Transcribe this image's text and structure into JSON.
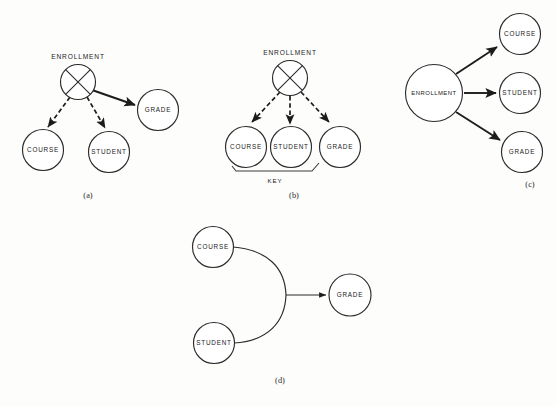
{
  "figure": {
    "background_color": "#fdfdfc",
    "stroke_color": "#1c1c1c",
    "panels": [
      {
        "id": "a",
        "caption": "(a)",
        "nodes": [
          {
            "name": "ENROLLMENT",
            "label": "ENROLLMENT",
            "shape": "crossed-circle",
            "label_position": "above"
          },
          {
            "name": "COURSE",
            "label": "COURSE",
            "shape": "circle",
            "label_position": "inside"
          },
          {
            "name": "STUDENT",
            "label": "STUDENT",
            "shape": "circle",
            "label_position": "inside"
          },
          {
            "name": "GRADE",
            "label": "GRADE",
            "shape": "circle",
            "label_position": "inside"
          }
        ],
        "edges": [
          {
            "from": "ENROLLMENT",
            "to": "COURSE",
            "style": "dashed",
            "arrow": true
          },
          {
            "from": "ENROLLMENT",
            "to": "STUDENT",
            "style": "dashed",
            "arrow": true
          },
          {
            "from": "ENROLLMENT",
            "to": "GRADE",
            "style": "solid",
            "arrow": true
          }
        ]
      },
      {
        "id": "b",
        "caption": "(b)",
        "key_label": "KEY",
        "nodes": [
          {
            "name": "ENROLLMENT",
            "label": "ENROLLMENT",
            "shape": "crossed-circle",
            "label_position": "above"
          },
          {
            "name": "COURSE",
            "label": "COURSE",
            "shape": "circle",
            "label_position": "inside"
          },
          {
            "name": "STUDENT",
            "label": "STUDENT",
            "shape": "circle",
            "label_position": "inside"
          },
          {
            "name": "GRADE",
            "label": "GRADE",
            "shape": "circle",
            "label_position": "inside"
          }
        ],
        "edges": [
          {
            "from": "ENROLLMENT",
            "to": "COURSE",
            "style": "dashed",
            "arrow": true
          },
          {
            "from": "ENROLLMENT",
            "to": "STUDENT",
            "style": "dashed",
            "arrow": true
          },
          {
            "from": "ENROLLMENT",
            "to": "GRADE",
            "style": "dashed",
            "arrow": true
          }
        ]
      },
      {
        "id": "c",
        "caption": "(c)",
        "nodes": [
          {
            "name": "ENROLLMENT",
            "label": "ENROLLMENT",
            "shape": "circle",
            "label_position": "inside"
          },
          {
            "name": "COURSE",
            "label": "COURSE",
            "shape": "circle",
            "label_position": "inside"
          },
          {
            "name": "STUDENT",
            "label": "STUDENT",
            "shape": "circle",
            "label_position": "inside"
          },
          {
            "name": "GRADE",
            "label": "GRADE",
            "shape": "circle",
            "label_position": "inside"
          }
        ],
        "edges": [
          {
            "from": "ENROLLMENT",
            "to": "COURSE",
            "style": "solid",
            "arrow": true
          },
          {
            "from": "ENROLLMENT",
            "to": "STUDENT",
            "style": "solid",
            "arrow": true
          },
          {
            "from": "ENROLLMENT",
            "to": "GRADE",
            "style": "solid",
            "arrow": true
          }
        ]
      },
      {
        "id": "d",
        "caption": "(d)",
        "nodes": [
          {
            "name": "COURSE",
            "label": "COURSE",
            "shape": "circle",
            "label_position": "inside"
          },
          {
            "name": "STUDENT",
            "label": "STUDENT",
            "shape": "circle",
            "label_position": "inside"
          },
          {
            "name": "GRADE",
            "label": "GRADE",
            "shape": "circle",
            "label_position": "inside"
          }
        ],
        "edges": [
          {
            "from": "COURSE",
            "to": "GRADE",
            "style": "curved-join",
            "arrow": true
          },
          {
            "from": "STUDENT",
            "to": "GRADE",
            "style": "curved-join",
            "arrow": true
          }
        ]
      }
    ]
  },
  "labels": {
    "enrollment": "ENROLLMENT",
    "course": "COURSE",
    "student": "STUDENT",
    "grade": "GRADE",
    "key": "KEY",
    "caption_a": "(a)",
    "caption_b": "(b)",
    "caption_c": "(c)",
    "caption_d": "(d)"
  }
}
